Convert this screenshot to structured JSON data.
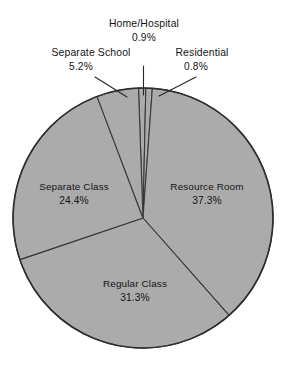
{
  "chart_data": {
    "type": "pie",
    "title": "",
    "subtitle": "",
    "xlabel": "",
    "ylabel": "",
    "legend_position": "none",
    "grid": false,
    "units": "percent",
    "total": 99.9,
    "categories": [
      "Home/Hospital",
      "Residential",
      "Resource Room",
      "Regular Class",
      "Separate Class",
      "Separate School"
    ],
    "values": [
      0.9,
      0.8,
      37.3,
      31.3,
      24.4,
      5.2
    ],
    "slices": [
      {
        "label": "Home/Hospital",
        "value": 0.9,
        "value_text": "0.9%",
        "label_placement": "outside",
        "color": "#ababab"
      },
      {
        "label": "Residential",
        "value": 0.8,
        "value_text": "0.8%",
        "label_placement": "outside",
        "color": "#ababab"
      },
      {
        "label": "Resource Room",
        "value": 37.3,
        "value_text": "37.3%",
        "label_placement": "inside",
        "color": "#ababab"
      },
      {
        "label": "Regular Class",
        "value": 31.3,
        "value_text": "31.3%",
        "label_placement": "inside",
        "color": "#ababab"
      },
      {
        "label": "Separate Class",
        "value": 24.4,
        "value_text": "24.4%",
        "label_placement": "inside",
        "color": "#ababab"
      },
      {
        "label": "Separate School",
        "value": 5.2,
        "value_text": "5.2%",
        "label_placement": "outside",
        "color": "#ababab"
      }
    ]
  },
  "style": {
    "slice_fill": "#ababab",
    "slice_stroke": "#3a3a3a",
    "outline_stroke": "#2e2e2e",
    "text_color": "#141414",
    "background": "#ffffff"
  },
  "labels": {
    "home_hospital_name": "Home/Hospital",
    "home_hospital_value": "0.9%",
    "separate_school_name": "Separate School",
    "separate_school_value": "5.2%",
    "residential_name": "Residential",
    "residential_value": "0.8%",
    "separate_class_name": "Separate Class",
    "separate_class_value": "24.4%",
    "resource_room_name": "Resource Room",
    "resource_room_value": "37.3%",
    "regular_class_name": "Regular Class",
    "regular_class_value": "31.3%"
  }
}
